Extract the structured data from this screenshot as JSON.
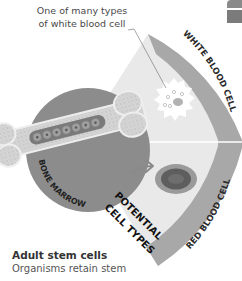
{
  "caption": {
    "line1": "One of many types",
    "line2": "of white blood cell"
  },
  "diagram": {
    "source_label": "BONE MARROW",
    "fan_label_line1": "POTENTIAL",
    "fan_label_line2": "CELL TYPES",
    "cell_types": [
      {
        "label": "WHITE BLOOD CELL",
        "icon": "white-blood-cell-icon"
      },
      {
        "label": "RED BLOOD CELL",
        "icon": "red-blood-cell-icon"
      }
    ],
    "colors": {
      "marrow_disc": "#8c8c8c",
      "fan_fill": "#e9e9e9",
      "band": "#a8a8a8",
      "band_text": "#2b2b2b",
      "rbc_outer": "#9a9a9a",
      "rbc_inner": "#5e5e5e",
      "wbc": "#ffffff"
    }
  },
  "body": {
    "title": "Adult stem cells",
    "line1": "Organisms retain stem"
  }
}
